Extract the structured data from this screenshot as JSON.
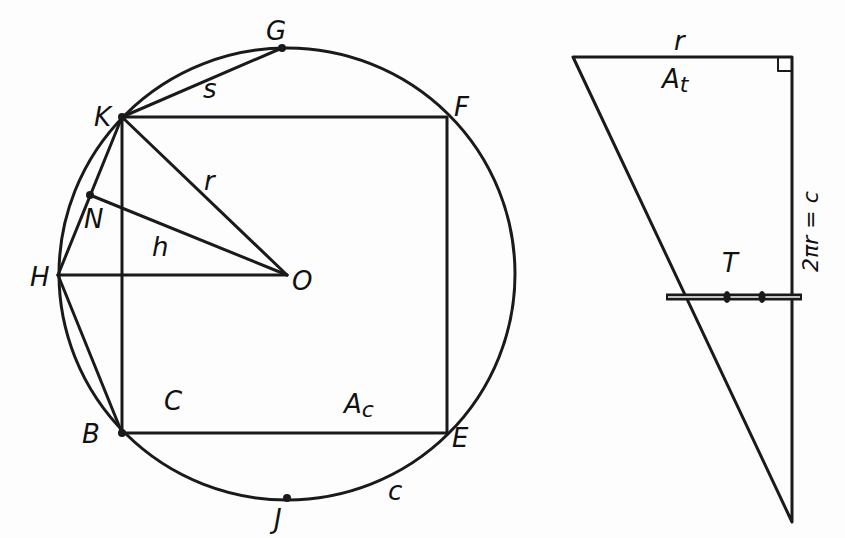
{
  "figure_left": {
    "title": "Circle with inscribed square and polygon construction",
    "points": {
      "G": "G",
      "K": "K",
      "F": "F",
      "H": "H",
      "N": "N",
      "O": "O",
      "B": "B",
      "E": "E",
      "J": "J"
    },
    "segment_labels": {
      "s": "s",
      "r": "r",
      "h": "h",
      "C": "C",
      "Ac": "A",
      "Ac_sub": "c",
      "c": "c"
    }
  },
  "figure_right": {
    "title": "Right triangle with base r and height 2πr = c",
    "labels": {
      "r": "r",
      "At": "A",
      "At_sub": "t",
      "height": "2πr = c",
      "T": "T"
    }
  },
  "colors": {
    "ink": "#1a1a1a",
    "paper": "#fdfdfd"
  }
}
